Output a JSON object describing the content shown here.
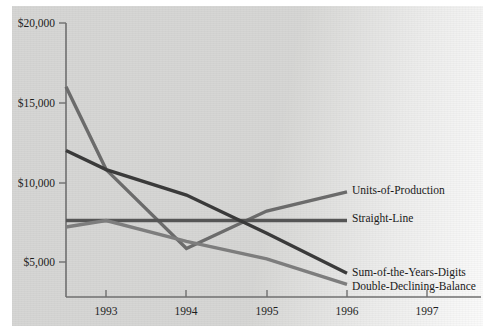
{
  "chart_data": {
    "type": "line",
    "title": "",
    "subtitle": "",
    "xlabel": "",
    "ylabel": "",
    "x": [
      1992.5,
      1993,
      1994,
      1995,
      1996
    ],
    "x_tick_labels": [
      "1993",
      "1994",
      "1995",
      "1996",
      "1997"
    ],
    "x_tick_values": [
      1993,
      1994,
      1995,
      1996,
      1997
    ],
    "xlim": [
      1992.5,
      1997.5
    ],
    "y_tick_labels": [
      "$20,000",
      "$15,000",
      "$10,000",
      "$5,000"
    ],
    "y_tick_values": [
      20000,
      15000,
      10000,
      5000
    ],
    "ylim": [
      2600,
      20000
    ],
    "grid": false,
    "legend_position": "right-inline-end-of-line",
    "series": [
      {
        "name": "Units-of-Production",
        "color": "#6b6b6b",
        "label": "Units-of-Production",
        "values": [
          16000,
          10800,
          5850,
          8200,
          9400
        ]
      },
      {
        "name": "Straight-Line",
        "color": "#555555",
        "label": "Straight-Line",
        "values": [
          7600,
          7600,
          7600,
          7600,
          7600
        ]
      },
      {
        "name": "Sum-of-the-Years-Digits",
        "color": "#3a3a3a",
        "label": "Sum-of-the-Years-Digits",
        "values": [
          12000,
          10800,
          9200,
          6800,
          4300
        ]
      },
      {
        "name": "Double-Declining-Balance",
        "color": "#7d7d7d",
        "label": "Double-Declining-Balance",
        "values": [
          7200,
          7600,
          6300,
          5200,
          3600
        ]
      }
    ]
  },
  "axis": {
    "y_ticks": [
      {
        "label": "$20,000",
        "value": 20000
      },
      {
        "label": "$15,000",
        "value": 15000
      },
      {
        "label": "$10,000",
        "value": 10000
      },
      {
        "label": "$5,000",
        "value": 5000
      }
    ],
    "x_ticks": [
      {
        "label": "1993",
        "value": 1993
      },
      {
        "label": "1994",
        "value": 1994
      },
      {
        "label": "1995",
        "value": 1995
      },
      {
        "label": "1996",
        "value": 1996
      },
      {
        "label": "1997",
        "value": 1997
      }
    ]
  },
  "colors": {
    "background": "#d6d6d4",
    "axis": "#6f6f6f",
    "text": "#1d1d1d"
  }
}
